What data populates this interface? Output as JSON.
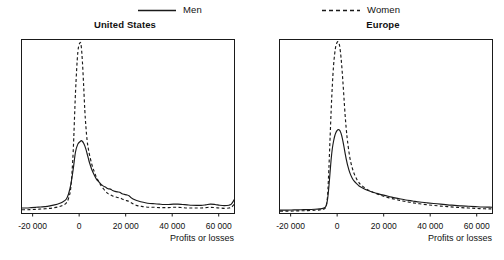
{
  "legend": {
    "entries": [
      {
        "label": "Men",
        "style": "solid",
        "color": "#1a1a1a"
      },
      {
        "label": "Women",
        "style": "dashed",
        "color": "#1a1a1a"
      }
    ],
    "men_label": "Men",
    "women_label": "Women"
  },
  "panels": {
    "us": {
      "title": "United States",
      "xlabel": "Profits or losses",
      "xticklabels": [
        "-20 000",
        "0",
        "20 000",
        "40 000",
        "60 000"
      ]
    },
    "eu": {
      "title": "Europe",
      "xlabel": "Profits or losses",
      "xticklabels": [
        "-20 000",
        "0",
        "20 000",
        "40 000",
        "60 000"
      ]
    }
  },
  "chart_data": [
    {
      "type": "line",
      "title": "United States",
      "xlabel": "Profits or losses",
      "ylabel": "",
      "xlim": [
        -25000,
        67000
      ],
      "ylim": [
        0,
        1.0
      ],
      "xticks": [
        -20000,
        0,
        20000,
        40000,
        60000
      ],
      "xticklabels": [
        "-20 000",
        "0",
        "20 000",
        "40 000",
        "60 000"
      ],
      "yticks": [],
      "grid": false,
      "legend_position": "above-figure",
      "x": [
        -25000,
        -23000,
        -21000,
        -19000,
        -17000,
        -15000,
        -13000,
        -11000,
        -9000,
        -7500,
        -6000,
        -5000,
        -4000,
        -3000,
        -2000,
        -1000,
        0,
        500,
        1000,
        1500,
        2000,
        2500,
        3000,
        3500,
        4000,
        5000,
        6000,
        7000,
        8000,
        9000,
        10000,
        11000,
        12000,
        13000,
        14000,
        15000,
        16000,
        17000,
        18000,
        19000,
        20000,
        21000,
        22000,
        23000,
        24000,
        25000,
        26000,
        28000,
        30000,
        32000,
        34000,
        36000,
        38000,
        40000,
        42000,
        44000,
        46000,
        48000,
        50000,
        52000,
        54000,
        56000,
        58000,
        60000,
        62000,
        64000,
        65000,
        66000,
        67000
      ],
      "series": [
        {
          "name": "Men",
          "style": "solid",
          "values": [
            0.04,
            0.04,
            0.042,
            0.044,
            0.046,
            0.048,
            0.052,
            0.058,
            0.066,
            0.075,
            0.09,
            0.12,
            0.175,
            0.26,
            0.36,
            0.405,
            0.42,
            0.425,
            0.42,
            0.41,
            0.395,
            0.375,
            0.35,
            0.325,
            0.3,
            0.26,
            0.23,
            0.205,
            0.19,
            0.175,
            0.165,
            0.158,
            0.15,
            0.148,
            0.14,
            0.135,
            0.132,
            0.13,
            0.122,
            0.118,
            0.115,
            0.11,
            0.098,
            0.09,
            0.084,
            0.08,
            0.076,
            0.07,
            0.066,
            0.064,
            0.062,
            0.06,
            0.06,
            0.062,
            0.062,
            0.06,
            0.058,
            0.056,
            0.055,
            0.055,
            0.058,
            0.062,
            0.06,
            0.056,
            0.054,
            0.056,
            0.062,
            0.082,
            0.11
          ]
        },
        {
          "name": "Women",
          "style": "dashed",
          "values": [
            0.03,
            0.03,
            0.031,
            0.032,
            0.034,
            0.036,
            0.038,
            0.042,
            0.048,
            0.055,
            0.068,
            0.095,
            0.16,
            0.36,
            0.7,
            0.93,
            0.985,
            0.96,
            0.87,
            0.74,
            0.6,
            0.5,
            0.425,
            0.38,
            0.345,
            0.29,
            0.25,
            0.215,
            0.19,
            0.168,
            0.15,
            0.135,
            0.122,
            0.116,
            0.108,
            0.104,
            0.1,
            0.098,
            0.092,
            0.086,
            0.082,
            0.078,
            0.07,
            0.062,
            0.056,
            0.052,
            0.05,
            0.046,
            0.044,
            0.044,
            0.042,
            0.042,
            0.042,
            0.044,
            0.044,
            0.042,
            0.04,
            0.04,
            0.04,
            0.04,
            0.042,
            0.044,
            0.042,
            0.04,
            0.038,
            0.04,
            0.044,
            0.058,
            0.075
          ]
        }
      ]
    },
    {
      "type": "line",
      "title": "Europe",
      "xlabel": "Profits or losses",
      "ylabel": "",
      "xlim": [
        -25000,
        67000
      ],
      "ylim": [
        0,
        1.0
      ],
      "xticks": [
        -20000,
        0,
        20000,
        40000,
        60000
      ],
      "xticklabels": [
        "-20 000",
        "0",
        "20 000",
        "40 000",
        "60 000"
      ],
      "yticks": [],
      "grid": false,
      "legend_position": "above-figure",
      "x": [
        -25000,
        -22000,
        -19000,
        -16000,
        -13000,
        -10000,
        -8000,
        -6500,
        -5500,
        -5000,
        -4500,
        -4000,
        -3500,
        -3000,
        -2500,
        -2000,
        -1500,
        -1000,
        -500,
        0,
        500,
        1000,
        1500,
        2000,
        2500,
        3000,
        3500,
        4000,
        5000,
        6000,
        7000,
        8000,
        9000,
        10000,
        12000,
        14000,
        16000,
        18000,
        20000,
        23000,
        26000,
        29000,
        32000,
        35000,
        38000,
        41000,
        44000,
        47000,
        50000,
        53000,
        56000,
        59000,
        62000,
        65000,
        67000
      ],
      "series": [
        {
          "name": "Men",
          "style": "solid",
          "values": [
            0.028,
            0.028,
            0.029,
            0.03,
            0.031,
            0.033,
            0.035,
            0.038,
            0.045,
            0.06,
            0.095,
            0.16,
            0.24,
            0.32,
            0.38,
            0.42,
            0.45,
            0.47,
            0.482,
            0.488,
            0.486,
            0.475,
            0.455,
            0.425,
            0.39,
            0.352,
            0.318,
            0.288,
            0.242,
            0.212,
            0.192,
            0.178,
            0.166,
            0.158,
            0.144,
            0.134,
            0.126,
            0.118,
            0.112,
            0.102,
            0.094,
            0.086,
            0.08,
            0.074,
            0.07,
            0.066,
            0.062,
            0.058,
            0.055,
            0.052,
            0.05,
            0.048,
            0.046,
            0.045,
            0.044
          ]
        },
        {
          "name": "Women",
          "style": "dashed",
          "values": [
            0.022,
            0.022,
            0.023,
            0.024,
            0.025,
            0.027,
            0.029,
            0.032,
            0.04,
            0.06,
            0.12,
            0.26,
            0.43,
            0.6,
            0.74,
            0.85,
            0.92,
            0.965,
            0.985,
            0.99,
            0.975,
            0.93,
            0.86,
            0.77,
            0.67,
            0.57,
            0.49,
            0.425,
            0.33,
            0.272,
            0.232,
            0.204,
            0.184,
            0.17,
            0.15,
            0.136,
            0.124,
            0.114,
            0.105,
            0.094,
            0.085,
            0.077,
            0.07,
            0.064,
            0.059,
            0.055,
            0.051,
            0.048,
            0.045,
            0.042,
            0.04,
            0.038,
            0.036,
            0.035,
            0.034
          ]
        }
      ]
    }
  ]
}
